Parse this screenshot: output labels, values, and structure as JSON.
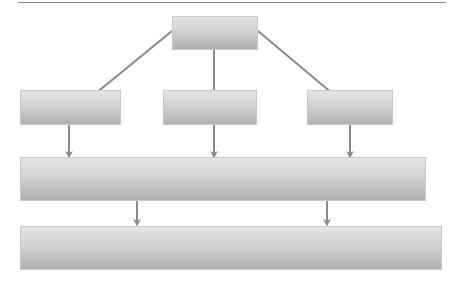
{
  "diagram": {
    "type": "hierarchy-flow",
    "colors": {
      "box_top": "#e4e4e4",
      "box_bottom": "#b0b0b0",
      "box_border": "#c8c8c8",
      "arrow": "#8a8a8a",
      "rule": "#8a8a8a"
    },
    "nodes": [
      {
        "id": "top",
        "label": "",
        "x": 172,
        "y": 16,
        "w": 86,
        "h": 34
      },
      {
        "id": "mid-left",
        "label": "",
        "x": 20,
        "y": 90,
        "w": 101,
        "h": 35
      },
      {
        "id": "mid-center",
        "label": "",
        "x": 163,
        "y": 90,
        "w": 94,
        "h": 35
      },
      {
        "id": "mid-right",
        "label": "",
        "x": 307,
        "y": 90,
        "w": 86,
        "h": 35
      },
      {
        "id": "wide-1",
        "label": "",
        "x": 20,
        "y": 157,
        "w": 406,
        "h": 44
      },
      {
        "id": "wide-2",
        "label": "",
        "x": 20,
        "y": 226,
        "w": 422,
        "h": 44
      }
    ],
    "edges": [
      {
        "from": "top",
        "to": "mid-left"
      },
      {
        "from": "top",
        "to": "mid-center"
      },
      {
        "from": "top",
        "to": "mid-right"
      },
      {
        "from": "mid-left",
        "to": "wide-1"
      },
      {
        "from": "mid-center",
        "to": "wide-1"
      },
      {
        "from": "mid-right",
        "to": "wide-1"
      },
      {
        "from": "wide-1",
        "to": "wide-2"
      },
      {
        "from": "wide-1",
        "to": "wide-2"
      }
    ]
  }
}
